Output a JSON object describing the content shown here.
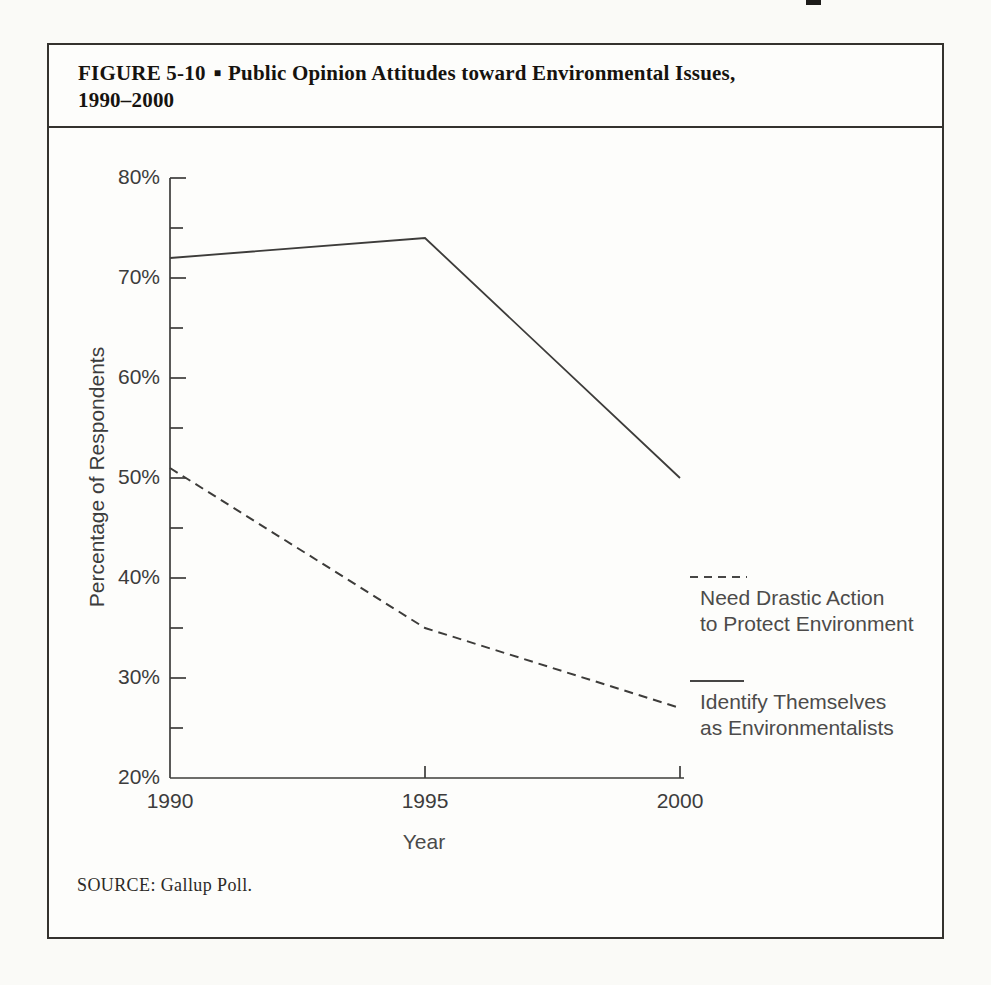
{
  "figure": {
    "label": "FIGURE 5-10",
    "separator": "■",
    "title_line1": "Public Opinion Attitudes toward Environmental Issues,",
    "title_line2": "1990–2000",
    "source": "SOURCE: Gallup Poll."
  },
  "chart_data": {
    "type": "line",
    "title": "Public Opinion Attitudes toward Environmental Issues, 1990–2000",
    "x": [
      1990,
      1995,
      2000
    ],
    "series": [
      {
        "name": "Need Drastic Action to Protect Environment",
        "style": "dashed",
        "values": [
          51,
          35,
          27
        ]
      },
      {
        "name": "Identify Themselves as Environmentalists",
        "style": "solid",
        "values": [
          72,
          74,
          50
        ]
      }
    ],
    "xlabel": "Year",
    "ylabel": "Percentage of Respondents",
    "ylim": [
      20,
      80
    ],
    "ytick_major_step": 10,
    "ytick_minor_step": 5,
    "ytick_labels": [
      "20%",
      "30%",
      "40%",
      "50%",
      "60%",
      "70%",
      "80%"
    ],
    "xtick_labels": [
      "1990",
      "1995",
      "2000"
    ],
    "grid": false,
    "legend_position": "right",
    "source": "SOURCE: Gallup Poll."
  },
  "legend": {
    "items": [
      {
        "line1": "Need Drastic Action",
        "line2": "to Protect Environment",
        "style": "dashed"
      },
      {
        "line1": "Identify Themselves",
        "line2": "as Environmentalists",
        "style": "solid"
      }
    ]
  },
  "colors": {
    "ink": "#3d3c3a",
    "paper": "#fafaf7",
    "box_border": "#34322e",
    "title_text": "#16130f",
    "legend_text": "#4c4b4a"
  }
}
